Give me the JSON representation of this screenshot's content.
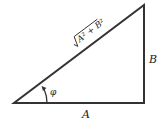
{
  "diagram": {
    "type": "right-triangle",
    "labels": {
      "base": "A",
      "height": "B",
      "hypotenuse": "A² + B²",
      "angle": "φ"
    },
    "colors": {
      "stroke": "#333333",
      "text": "#222222",
      "background": "#ffffff"
    }
  }
}
